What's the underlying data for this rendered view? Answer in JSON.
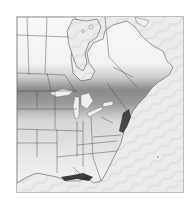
{
  "map": {
    "region": "Eastern North America",
    "style": "grayscale",
    "colors": {
      "ocean": "#e9e9e9",
      "land_light": "#f7f7f7",
      "land_mid": "#bdbdbd",
      "land_dark": "#6e6e6e",
      "lakes": "#f2f2f2",
      "border": "#3a3a3a",
      "frame": "#bdbdbd"
    },
    "features": [
      "Hudson Bay",
      "Great Lakes",
      "Gulf of Mexico",
      "Atlantic Ocean",
      "state boundaries",
      "province boundaries"
    ]
  }
}
